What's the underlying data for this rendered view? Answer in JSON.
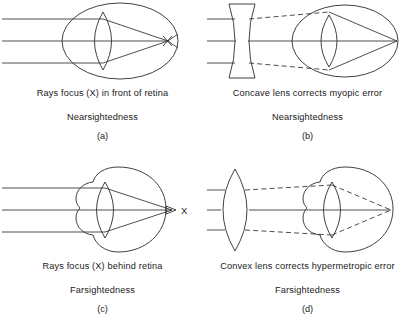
{
  "figure": {
    "background_color": "#ffffff",
    "line_color": "#2b2b2b",
    "text_color": "#1a1a1a",
    "panel_count": 4
  },
  "panels": [
    {
      "id": "a",
      "letter": "(a)",
      "caption": "Rays focus (X) in front of retina",
      "condition": "Nearsightedness",
      "condition_medical": "myopia",
      "eye_shape": "elongated-ellipse",
      "corrective_lens": "none",
      "focal_point_label": "X",
      "focal_point_position": "in-front-of-retina",
      "ray_count": 3,
      "ray_style": "solid"
    },
    {
      "id": "b",
      "letter": "(b)",
      "caption": "Concave lens corrects myopic error",
      "condition": "Nearsightedness",
      "condition_medical": "myopia",
      "eye_shape": "elongated-ellipse",
      "corrective_lens": "concave",
      "focal_point_label": "",
      "focal_point_position": "on-retina",
      "ray_count": 3,
      "ray_style": "dashed-after-lens"
    },
    {
      "id": "c",
      "letter": "(c)",
      "caption": "Rays focus (X) behind retina",
      "condition": "Farsightedness",
      "condition_medical": "hypermetropia",
      "eye_shape": "shortened-lobed",
      "corrective_lens": "none",
      "focal_point_label": "X",
      "focal_point_position": "behind-retina",
      "ray_count": 3,
      "ray_style": "solid"
    },
    {
      "id": "d",
      "letter": "(d)",
      "caption": "Convex lens corrects hypermetropic error",
      "condition": "Farsightedness",
      "condition_medical": "hypermetropia",
      "eye_shape": "shortened-lobed",
      "corrective_lens": "convex",
      "focal_point_label": "",
      "focal_point_position": "on-retina",
      "ray_count": 3,
      "ray_style": "dashed-after-lens"
    }
  ]
}
